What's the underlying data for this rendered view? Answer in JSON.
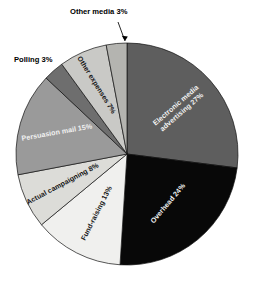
{
  "chart_data": {
    "type": "pie",
    "title": "",
    "subtitle": "",
    "xlabel": "",
    "ylabel": "",
    "legend_position": "none",
    "grid": false,
    "labels_inside_slices": true,
    "units": "percent",
    "total": 100,
    "categories": [
      "Electronic media advertising",
      "Overhead",
      "Fund-raising",
      "Actual campaigning",
      "Persuasion mail",
      "Polling",
      "Other expenses",
      "Other media"
    ],
    "values": [
      27,
      24,
      13,
      8,
      15,
      3,
      7,
      3
    ],
    "slices": [
      {
        "name": "electronic-media-advertising",
        "label": "Electronic media advertising 27%",
        "label_line1": "Electronic media",
        "label_line2": "advertising 27%",
        "value": 27,
        "color": "#5e5e5e",
        "text_color": "#f2f2f2",
        "start_angle": 0,
        "end_angle": 97.2,
        "label_angle": 48.6,
        "label_rotation": -41,
        "label_radius": 0.62,
        "callout": false
      },
      {
        "name": "overhead",
        "label": "Overhead 24%",
        "label_line1": "Overhead 24%",
        "label_line2": "",
        "value": 24,
        "color": "#080808",
        "text_color": "#f2f2f2",
        "start_angle": 97.2,
        "end_angle": 183.6,
        "label_angle": 140.4,
        "label_rotation": -50,
        "label_radius": 0.58,
        "callout": false
      },
      {
        "name": "fund-raising",
        "label": "Fund-raising 13%",
        "label_line1": "Fund-raising 13%",
        "label_line2": "",
        "value": 13,
        "color": "#f0f0ee",
        "text_color": "#141414",
        "start_angle": 183.6,
        "end_angle": 230.4,
        "label_angle": 207,
        "label_rotation": -63,
        "label_radius": 0.6,
        "callout": false
      },
      {
        "name": "actual-campaigning",
        "label": "Actual campaigning 8%",
        "label_line1": "Actual campaigning 8%",
        "label_line2": "",
        "value": 8,
        "color": "#dcdcd8",
        "text_color": "#141414",
        "start_angle": 230.4,
        "end_angle": 259.2,
        "label_angle": 245,
        "label_rotation": -28,
        "label_radius": 0.64,
        "callout": false
      },
      {
        "name": "persuasion-mail",
        "label": "Persuasion mail 15%",
        "label_line1": "Persuasion mail 15%",
        "label_line2": "",
        "value": 15,
        "color": "#9a9a9a",
        "text_color": "#f2f2f2",
        "start_angle": 259.2,
        "end_angle": 313.2,
        "label_angle": 287,
        "label_rotation": -10,
        "label_radius": 0.66,
        "callout": false
      },
      {
        "name": "polling",
        "label": "Polling 3%",
        "label_line1": "Polling 3%",
        "label_line2": "",
        "value": 3,
        "color": "#6e6e6e",
        "text_color": "#000000",
        "start_angle": 313.2,
        "end_angle": 324,
        "label_angle": 318.6,
        "label_rotation": 0,
        "label_radius": 1.0,
        "callout": true,
        "callout_text_x": 14,
        "callout_text_y": 62
      },
      {
        "name": "other-expenses",
        "label": "Other expenses 7%",
        "label_line1": "Other expenses 7%",
        "label_line2": "",
        "value": 7,
        "color": "#c9c9c6",
        "text_color": "#141414",
        "start_angle": 324,
        "end_angle": 349.2,
        "label_angle": 336,
        "label_rotation": 58,
        "label_radius": 0.68,
        "callout": false
      },
      {
        "name": "other-media",
        "label": "Other media 3%",
        "label_line1": "Other media 3%",
        "label_line2": "",
        "value": 3,
        "color": "#b4b4b0",
        "text_color": "#000000",
        "start_angle": 349.2,
        "end_angle": 360,
        "label_angle": 354.6,
        "label_rotation": 0,
        "label_radius": 1.0,
        "callout": true,
        "callout_text_x": 70,
        "callout_text_y": 14
      }
    ],
    "geometry": {
      "center_x": 127,
      "center_y": 154,
      "radius": 111,
      "start_offset_deg": -90,
      "direction": "clockwise"
    },
    "colors": {
      "background": "#ffffff",
      "outline": "#111111",
      "label_light": "#f2f2f2",
      "label_dark": "#141414"
    }
  },
  "callouts": {
    "other_media": {
      "text": "Other media 3%",
      "line_from_x": 118,
      "line_from_y": 22,
      "line_to_x": 125,
      "line_to_y": 41
    },
    "polling": {
      "text": "Polling 3%",
      "line_from_x": 0,
      "line_from_y": 0,
      "line_to_x": 0,
      "line_to_y": 0
    }
  }
}
